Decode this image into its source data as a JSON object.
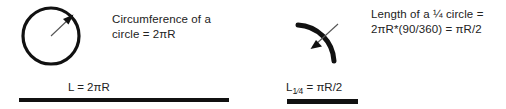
{
  "figure": {
    "background_color": "#ffffff",
    "ink_color": "#111111"
  },
  "panels": [
    {
      "id": "circumference",
      "shape_name": "full-circle-with-radius-arrow",
      "caption_line_1": "Circumference of a",
      "caption_line_2": "circle = 2πR",
      "result_prefix": "L = ",
      "result_value": "2πR",
      "result_subscript": "",
      "rule_width_px": 210
    },
    {
      "id": "quarter-arc",
      "shape_name": "quarter-circle-arc-with-arrow",
      "caption_line_1": "Length of a ¼ circle =",
      "caption_line_2": "2πR*(90/360) = πR/2",
      "result_prefix": "L",
      "result_subscript": "1⁄4",
      "result_value": " = πR/2",
      "rule_width_px": 71
    }
  ],
  "math": {
    "full_circle_degrees": 360,
    "quarter_circle_degrees": 90,
    "quarter_fraction": "90/360",
    "pi_symbol": "π"
  }
}
